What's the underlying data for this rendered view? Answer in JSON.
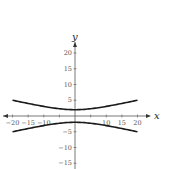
{
  "chart_data": {
    "type": "line",
    "title": "",
    "xlabel": "x",
    "ylabel": "y",
    "xlim": [
      -20,
      20
    ],
    "ylim": [
      -15,
      20
    ],
    "grid": false,
    "legend": null,
    "x_ticks": [
      -20,
      -15,
      -10,
      10,
      15,
      20
    ],
    "x_tick_labels": [
      "−20",
      "−15",
      "−10",
      "10",
      "15",
      "20"
    ],
    "y_ticks": [
      20,
      15,
      10,
      5,
      -5,
      -10,
      -15
    ],
    "y_tick_labels": [
      "20",
      "15",
      "10",
      "5",
      "−5",
      "−10",
      "−15"
    ],
    "series": [
      {
        "name": "upper branch",
        "x": [
          -20,
          -15,
          -10,
          -5,
          0,
          5,
          10,
          15,
          20
        ],
        "y": [
          4.9,
          4.0,
          3.0,
          2.3,
          2.0,
          2.3,
          3.0,
          4.0,
          4.9
        ]
      },
      {
        "name": "lower branch",
        "x": [
          -20,
          -15,
          -10,
          -5,
          0,
          5,
          10,
          15,
          20
        ],
        "y": [
          -4.9,
          -4.0,
          -3.0,
          -2.3,
          -2.0,
          -2.3,
          -3.0,
          -4.0,
          -4.9
        ]
      }
    ],
    "style": {
      "curve_color": "#1a1a1a",
      "axis_color": "#555555"
    }
  }
}
